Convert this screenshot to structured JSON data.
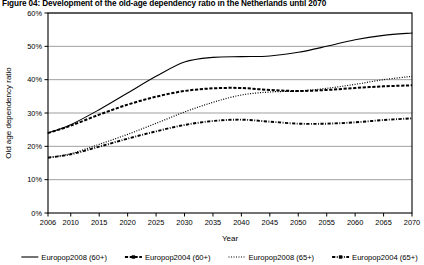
{
  "figure": {
    "title": "Figure 04: Development of the old-age dependency ratio in the Netherlands until 2070"
  },
  "chart_data": {
    "type": "line",
    "title": "Figure 04: Development of the old-age dependency ratio in the Netherlands until 2070",
    "xlabel": "Year",
    "ylabel": "Old age dependency ratio",
    "xlim": [
      2006,
      2070
    ],
    "ylim": [
      0,
      60
    ],
    "grid": true,
    "grid_axis": "y",
    "legend_position": "bottom",
    "y_ticks": [
      "0%",
      "10%",
      "20%",
      "30%",
      "40%",
      "50%",
      "60%"
    ],
    "y_tick_values": [
      0,
      10,
      20,
      30,
      40,
      50,
      60
    ],
    "x_ticks": [
      "2006",
      "2010",
      "2015",
      "2020",
      "2025",
      "2030",
      "2035",
      "2040",
      "2045",
      "2050",
      "2055",
      "2060",
      "2065",
      "2070"
    ],
    "x_tick_values": [
      2006,
      2010,
      2015,
      2020,
      2025,
      2030,
      2035,
      2040,
      2045,
      2050,
      2055,
      2060,
      2065,
      2070
    ],
    "x": [
      2006,
      2010,
      2015,
      2020,
      2025,
      2030,
      2035,
      2040,
      2045,
      2050,
      2055,
      2060,
      2065,
      2070
    ],
    "series": [
      {
        "name": "Europop2008 (60+)",
        "style": "solid",
        "marker": "none",
        "color": "#000000",
        "values": [
          24.0,
          26.5,
          31.0,
          36.0,
          41.0,
          45.3,
          46.7,
          46.9,
          47.1,
          48.2,
          50.0,
          52.0,
          53.3,
          54.0
        ]
      },
      {
        "name": "Europop2004 (60+)",
        "style": "dashed",
        "marker": "square",
        "color": "#000000",
        "values": [
          24.0,
          26.2,
          29.5,
          32.5,
          34.9,
          36.6,
          37.4,
          37.5,
          36.9,
          36.6,
          36.9,
          37.5,
          38.0,
          38.3
        ]
      },
      {
        "name": "Europop2008 (65+)",
        "style": "dotted",
        "marker": "none",
        "color": "#000000",
        "values": [
          16.6,
          17.8,
          20.6,
          23.6,
          26.9,
          30.3,
          33.2,
          35.4,
          36.3,
          36.6,
          37.4,
          38.6,
          40.0,
          41.0
        ]
      },
      {
        "name": "Europop2004 (65+)",
        "style": "dashdot",
        "marker": "square",
        "color": "#000000",
        "values": [
          16.6,
          17.6,
          19.9,
          22.3,
          24.5,
          26.4,
          27.6,
          28.0,
          27.4,
          26.8,
          26.8,
          27.2,
          27.9,
          28.4
        ]
      }
    ]
  },
  "axes": {
    "y_label": "Old age dependency ratio",
    "x_label": "Year",
    "y_ticks": [
      {
        "label": "60%",
        "value": 60
      },
      {
        "label": "50%",
        "value": 50
      },
      {
        "label": "40%",
        "value": 40
      },
      {
        "label": "30%",
        "value": 30
      },
      {
        "label": "20%",
        "value": 20
      },
      {
        "label": "10%",
        "value": 10
      },
      {
        "label": "0%",
        "value": 0
      }
    ],
    "x_ticks": [
      {
        "label": "2006",
        "value": 2006
      },
      {
        "label": "2010",
        "value": 2010
      },
      {
        "label": "2015",
        "value": 2015
      },
      {
        "label": "2020",
        "value": 2020
      },
      {
        "label": "2025",
        "value": 2025
      },
      {
        "label": "2030",
        "value": 2030
      },
      {
        "label": "2035",
        "value": 2035
      },
      {
        "label": "2040",
        "value": 2040
      },
      {
        "label": "2045",
        "value": 2045
      },
      {
        "label": "2050",
        "value": 2050
      },
      {
        "label": "2055",
        "value": 2055
      },
      {
        "label": "2060",
        "value": 2060
      },
      {
        "label": "2065",
        "value": 2065
      },
      {
        "label": "2070",
        "value": 2070
      }
    ]
  },
  "legend": {
    "items": [
      {
        "label": "Europop2008 (60+)",
        "style": "solid",
        "marker": "none"
      },
      {
        "label": "Europop2004 (60+)",
        "style": "dashed",
        "marker": "square"
      },
      {
        "label": "Europop2008 (65+)",
        "style": "dotted",
        "marker": "none"
      },
      {
        "label": "Europop2004 (65+)",
        "style": "dashdot",
        "marker": "square"
      }
    ]
  }
}
